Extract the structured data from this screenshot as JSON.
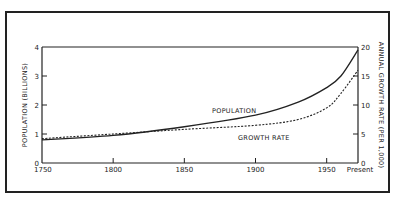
{
  "chart_data": {
    "type": "line",
    "title": "",
    "xlabel": "",
    "ylabel": "POPULATION (BILLIONS)",
    "y2label": "ANNUAL GROWTH RATE (PER 1,000)",
    "x_ticks": [
      "1750",
      "1800",
      "1850",
      "1900",
      "1950",
      "Present"
    ],
    "y_ticks": [
      "0",
      "1",
      "2",
      "3",
      "4"
    ],
    "y2_ticks": [
      "0",
      "5",
      "10",
      "15",
      "20"
    ],
    "xlim": [
      1750,
      1972
    ],
    "ylim": [
      0,
      4
    ],
    "y2lim": [
      0,
      20
    ],
    "grid": false,
    "x": [
      1750,
      1800,
      1850,
      1900,
      1930,
      1950,
      1960,
      1972
    ],
    "series": [
      {
        "name": "POPULATION",
        "axis": "left",
        "style": "solid",
        "values": [
          0.8,
          0.95,
          1.25,
          1.65,
          2.1,
          2.6,
          3.0,
          3.9
        ]
      },
      {
        "name": "GROWTH RATE",
        "axis": "right",
        "style": "dashed",
        "values": [
          4.2,
          5.0,
          5.8,
          6.5,
          7.5,
          9.5,
          12.0,
          16.0
        ]
      }
    ],
    "annotations": [
      "POPULATION",
      "GROWTH RATE"
    ]
  }
}
